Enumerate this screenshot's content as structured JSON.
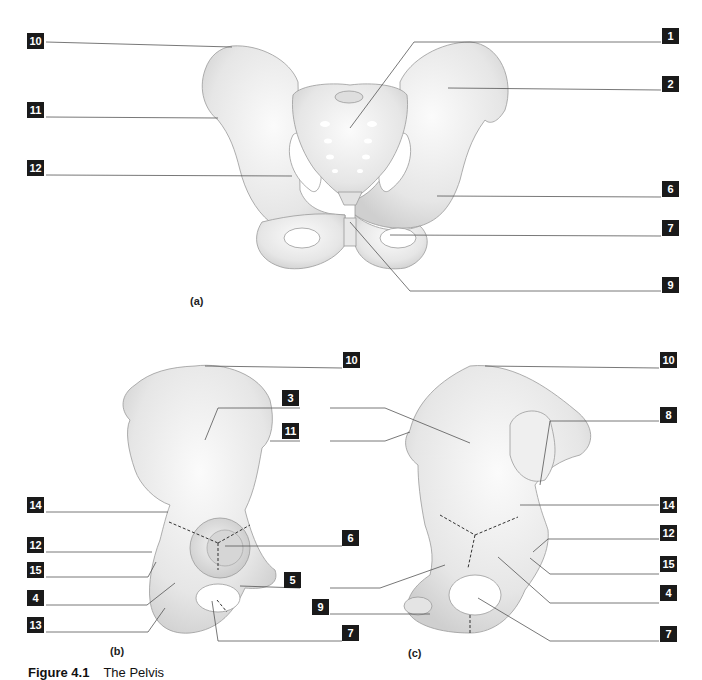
{
  "figure": {
    "caption_number": "Figure 4.1",
    "caption_title": "The Pelvis",
    "colors": {
      "label_bg": "#1a1a1a",
      "label_text": "#ffffff",
      "bone_fill": "#eeeeee",
      "bone_shade": "#cfcfcf",
      "leader_line": "#555555"
    }
  },
  "views": [
    {
      "id": "a",
      "caption": "(a)",
      "labels": [
        {
          "text": "10"
        },
        {
          "text": "11"
        },
        {
          "text": "12"
        },
        {
          "text": "1"
        },
        {
          "text": "2"
        },
        {
          "text": "6"
        },
        {
          "text": "7"
        },
        {
          "text": "9"
        }
      ]
    },
    {
      "id": "b",
      "caption": "(b)",
      "labels": [
        {
          "text": "10"
        },
        {
          "text": "3"
        },
        {
          "text": "11"
        },
        {
          "text": "14"
        },
        {
          "text": "6"
        },
        {
          "text": "12"
        },
        {
          "text": "15"
        },
        {
          "text": "5"
        },
        {
          "text": "4"
        },
        {
          "text": "9"
        },
        {
          "text": "13"
        },
        {
          "text": "7"
        }
      ]
    },
    {
      "id": "c",
      "caption": "(c)",
      "labels": [
        {
          "text": "10"
        },
        {
          "text": "8"
        },
        {
          "text": "14"
        },
        {
          "text": "12"
        },
        {
          "text": "15"
        },
        {
          "text": "4"
        },
        {
          "text": "7"
        }
      ]
    }
  ]
}
